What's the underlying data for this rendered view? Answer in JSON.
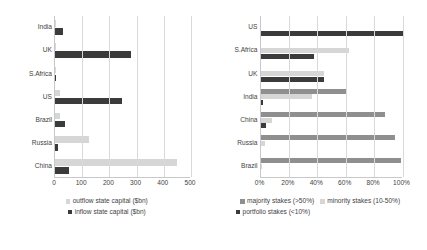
{
  "chart_data": [
    {
      "panel": "left",
      "type": "bar",
      "orientation": "horizontal",
      "title": "",
      "xlabel": "",
      "ylabel": "",
      "xlim": [
        0,
        500
      ],
      "xticks": [
        "0",
        "100",
        "200",
        "300",
        "400",
        "500"
      ],
      "xtick_values": [
        0,
        100,
        200,
        300,
        400,
        500
      ],
      "grid": "vertical",
      "legend_position": "bottom",
      "categories": [
        "India",
        "UK",
        "S.Africa",
        "US",
        "Brazil",
        "Russia",
        "China"
      ],
      "series": [
        {
          "name": "outflow state capital ($bn)",
          "color": "#d6d6d6",
          "values": [
            2,
            4,
            3,
            20,
            18,
            125,
            450
          ]
        },
        {
          "name": "inflow state capital ($bn)",
          "color": "#3b3b3b",
          "values": [
            30,
            280,
            5,
            245,
            35,
            12,
            50
          ]
        }
      ]
    },
    {
      "panel": "right",
      "type": "bar",
      "orientation": "horizontal",
      "title": "",
      "xlabel": "",
      "ylabel": "",
      "xlim": [
        0,
        100
      ],
      "xticks": [
        "0%",
        "20%",
        "40%",
        "60%",
        "80%",
        "100%"
      ],
      "xtick_values": [
        0,
        20,
        40,
        60,
        80,
        100
      ],
      "grid": "vertical",
      "legend_position": "bottom",
      "categories": [
        "US",
        "S.Africa",
        "UK",
        "India",
        "China",
        "Russia",
        "Brazil"
      ],
      "series": [
        {
          "name": "majority stakes (>50%)",
          "color": "#8f8f8f",
          "values": [
            0,
            0,
            0,
            60,
            88,
            95,
            99
          ]
        },
        {
          "name": "minority stakes (10-50%)",
          "color": "#d6d6d6",
          "values": [
            0,
            62,
            45,
            36,
            8,
            3,
            1
          ]
        },
        {
          "name": "portfolio stakes (<10%)",
          "color": "#3b3b3b",
          "values": [
            100,
            38,
            45,
            2,
            4,
            0,
            0
          ]
        }
      ]
    }
  ],
  "left_chart": {
    "categories": [
      "India",
      "UK",
      "S.Africa",
      "US",
      "Brazil",
      "Russia",
      "China"
    ],
    "xticks": [
      "0",
      "100",
      "200",
      "300",
      "400",
      "500"
    ],
    "legend": [
      {
        "label": "outflow state capital ($bn)",
        "swatch": "light"
      },
      {
        "label": "inflow state capital ($bn)",
        "swatch": "dark"
      }
    ]
  },
  "right_chart": {
    "categories": [
      "US",
      "S.Africa",
      "UK",
      "India",
      "China",
      "Russia",
      "Brazil"
    ],
    "xticks": [
      "0%",
      "20%",
      "40%",
      "60%",
      "80%",
      "100%"
    ],
    "legend": [
      {
        "label": "majority stakes (>50%)",
        "swatch": "mid"
      },
      {
        "label": "minority stakes (10-50%)",
        "swatch": "light"
      },
      {
        "label": "portfolio stakes (<10%)",
        "swatch": "dark"
      }
    ]
  }
}
